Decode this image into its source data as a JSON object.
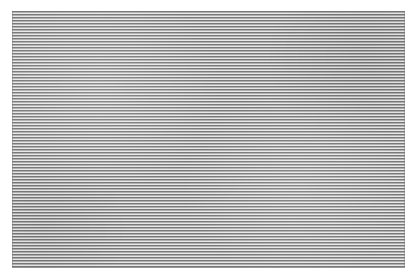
{
  "canvas": {
    "width": 415,
    "height": 279,
    "background_color": "#ffffff"
  },
  "swatch": {
    "label": "horizontal stripe pattern",
    "x": 12,
    "y": 11,
    "width": 393,
    "height": 257,
    "orientation": "horizontal",
    "period_px": 3,
    "dark_band_color": "#787878",
    "light_band_color": "#b0b0b0",
    "highlight_line_color": "#e8e8e8",
    "dark_band_height_px": 1.4,
    "light_band_height_px": 1.0,
    "highlight_line_height_px": 0.6,
    "approx_cycle_count": 86
  }
}
